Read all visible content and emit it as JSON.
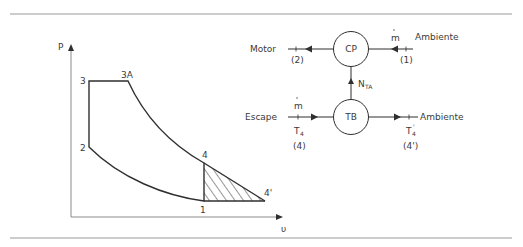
{
  "pv_diagram": {
    "axis_y_label": "P",
    "axis_x_label": "υ",
    "points": {
      "p1": "1",
      "p2": "2",
      "p3": "3",
      "p3a": "3A",
      "p4": "4",
      "p4p": "4'"
    }
  },
  "schematic": {
    "compressor": {
      "label": "CP"
    },
    "turbine": {
      "label": "TB"
    },
    "shaft_label": "N",
    "shaft_sub": "TA",
    "top_left_label": "Motor",
    "top_left_station": "(2)",
    "top_right_label": "Ambiente",
    "top_right_station": "(1)",
    "top_flow": "m",
    "bottom_left_label": "Escape",
    "bottom_left_flow": "m",
    "bottom_left_temp": "T",
    "bottom_left_temp_sub": "4",
    "bottom_left_station": "(4)",
    "bottom_right_label": "Ambiente",
    "bottom_right_temp": "T",
    "bottom_right_temp_sub": "4",
    "bottom_right_temp_prime": "'",
    "bottom_right_station": "(4')"
  },
  "colors": {
    "line": "#2f2f2f",
    "rule": "#9a9a9a",
    "text": "#3a3a3a"
  }
}
